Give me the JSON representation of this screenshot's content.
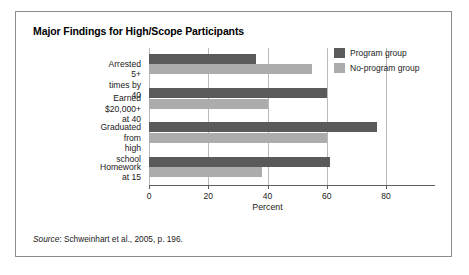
{
  "figure": {
    "title": "Major Findings for High/Scope Participants",
    "source_word": "Source",
    "source_text": ": Schweinhart et al., 2005, p. 196."
  },
  "legend": {
    "position": "top-right",
    "entries": [
      {
        "label": "Program group",
        "color": "#5a5a5a"
      },
      {
        "label": "No-program group",
        "color": "#acacac"
      }
    ]
  },
  "chart_data": {
    "type": "bar",
    "orientation": "horizontal",
    "title": "Major Findings for High/Scope Participants",
    "xlabel": "Percent",
    "ylabel": "",
    "xlim": [
      0,
      80
    ],
    "xticks": [
      0,
      20,
      40,
      60,
      80
    ],
    "xticklabels": [
      "0",
      "20",
      "40",
      "60",
      "80"
    ],
    "grid": true,
    "grid_axis": "x",
    "categories": [
      "Arrested 5+ times by 40",
      "Earned $20,000+ at 40",
      "Graduated from\nhigh school",
      "Homework at 15"
    ],
    "series": [
      {
        "name": "Program group",
        "color": "#5a5a5a",
        "values": [
          36,
          60,
          77,
          61
        ]
      },
      {
        "name": "No-program group",
        "color": "#acacac",
        "values": [
          55,
          40,
          60,
          38
        ]
      }
    ]
  }
}
